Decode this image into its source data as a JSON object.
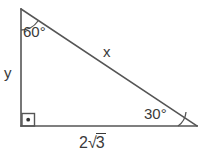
{
  "diagram": {
    "type": "right-triangle-geometry",
    "background_color": "#ffffff",
    "stroke_color": "#555555",
    "text_color": "#3a3a3a",
    "angles": {
      "top_vertex": "60°",
      "bottom_right_vertex": "30°",
      "bottom_left_vertex": "90°"
    },
    "sides": {
      "vertical_leg": "y",
      "hypotenuse": "x",
      "base_coefficient": "2",
      "base_radical_sign": "√",
      "base_radicand": "3",
      "base_full": "2√3"
    },
    "markers": {
      "right_angle": "right-angle-square-with-dot"
    }
  }
}
